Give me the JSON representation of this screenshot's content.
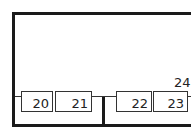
{
  "diagram": {
    "components": [
      {
        "id": "20",
        "label": "20"
      },
      {
        "id": "21",
        "label": "21"
      },
      {
        "id": "22",
        "label": "22"
      },
      {
        "id": "23",
        "label": "23"
      }
    ],
    "labels": [
      {
        "id": "24",
        "text": "24"
      }
    ],
    "colors": {
      "line": "#1a1a1a",
      "background": "#ffffff"
    }
  }
}
